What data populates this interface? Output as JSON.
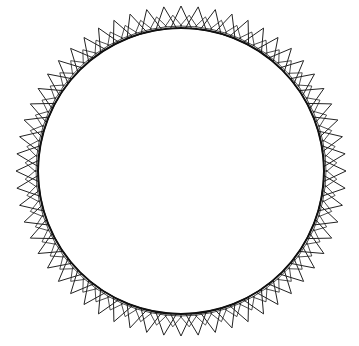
{
  "diagram": {
    "shape": "gear-like circle with outward triangular teeth",
    "canvas": {
      "width": 359,
      "height": 346,
      "background": "#ffffff"
    },
    "circle": {
      "cx": 181,
      "cy": 171,
      "r": 143,
      "stroke": "#111111",
      "stroke_width": 2
    },
    "teeth": {
      "count": 60,
      "outer_r": 165,
      "half_base_deg": 4.2,
      "stroke": "#222222",
      "stroke_width": 1,
      "overlap": true
    }
  }
}
